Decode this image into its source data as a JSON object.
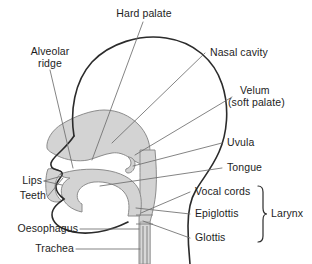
{
  "diagram": {
    "background_color": "#ffffff",
    "outline_color": "#2b2b2b",
    "tract_fill_color": "#d3d3d3",
    "tract_stroke_color": "#8c8c8c",
    "leader_color": "#6e6e6e",
    "text_color": "#1d1d1d",
    "labels": {
      "hard_palate": "Hard palate",
      "alveolar_ridge_line1": "Alveolar",
      "alveolar_ridge_line2": "ridge",
      "nasal_cavity": "Nasal cavity",
      "velum_line1": "Velum",
      "velum_line2": "(soft palate)",
      "uvula": "Uvula",
      "tongue": "Tongue",
      "vocal_cords": "Vocal cords",
      "epiglottis": "Epiglottis",
      "glottis": "Glottis",
      "larynx": "Larynx",
      "lips": "Lips",
      "teeth": "Teeth",
      "oesophagus": "Oesophagus",
      "trachea": "Trachea"
    }
  }
}
